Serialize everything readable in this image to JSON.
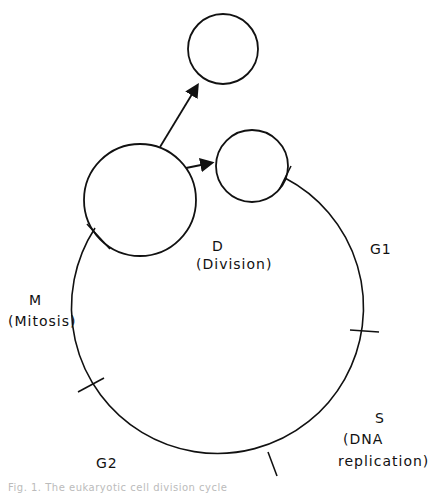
{
  "diagram": {
    "title": "Cell division cycle",
    "phases": [
      {
        "key": "D",
        "label": "D",
        "sublabel": "(Division)"
      },
      {
        "key": "G1",
        "label": "G1",
        "sublabel": ""
      },
      {
        "key": "S",
        "label": "S",
        "sublabel_line1": "(DNA",
        "sublabel_line2": "replication)"
      },
      {
        "key": "G2",
        "label": "G2",
        "sublabel": ""
      },
      {
        "key": "M",
        "label": "M",
        "sublabel": "(Mitosis)"
      }
    ],
    "caption": "Fig. 1. The eukaryotic cell division cycle"
  }
}
